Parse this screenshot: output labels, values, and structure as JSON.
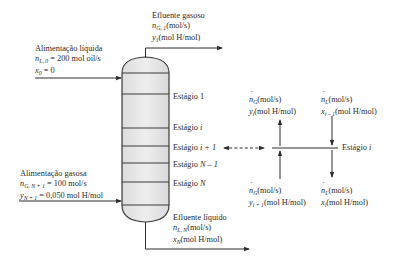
{
  "diagram": {
    "type": "absorption column schematic",
    "column": {
      "stages": [
        {
          "label_prefix": "Estágio",
          "index": "1"
        },
        {
          "label_prefix": "Estágio",
          "index": "i"
        },
        {
          "label_prefix": "Estágio",
          "index": "i + 1"
        },
        {
          "label_prefix": "Estágio",
          "index": "N – 1"
        },
        {
          "label_prefix": "Estágio",
          "index": "N"
        }
      ]
    },
    "liquid_feed": {
      "title": "Alimentação líquida",
      "flow_symbol": "n",
      "flow_sub": "L, 0",
      "flow_value": " = 200 mol oil/s",
      "comp_symbol": "x",
      "comp_sub": "0",
      "comp_value": " = 0"
    },
    "gas_effluent": {
      "title": "Efluente gasoso",
      "flow_symbol": "n",
      "flow_sub": "G, 1",
      "flow_unit": "(mol/s)",
      "comp_symbol": "y",
      "comp_sub": "1",
      "comp_unit": "(mol H/mol)"
    },
    "gas_feed": {
      "title": "Alimentação gasosa",
      "flow_symbol": "n",
      "flow_sub": "G, N + 1",
      "flow_value": " = 100 mol/s",
      "comp_symbol": "y",
      "comp_sub": "N + 1",
      "comp_value": " = 0,050 mol H/mol"
    },
    "liquid_effluent": {
      "title": "Efluente líquido",
      "flow_symbol": "n",
      "flow_sub": "L, N",
      "flow_unit": "(mol/s)",
      "comp_symbol": "x",
      "comp_sub": "N",
      "comp_unit": "(mol H/mol)"
    },
    "stage_detail": {
      "stage_label_prefix": "Estágio",
      "stage_label_index": "i",
      "gas_out": {
        "flow_symbol": "n",
        "flow_sub": "G",
        "flow_unit": "(mol/s)",
        "comp_symbol": "y",
        "comp_sub": "i",
        "comp_unit": "(mol H/mol)"
      },
      "liquid_in": {
        "flow_symbol": "n",
        "flow_sub": "L",
        "flow_unit": "(mol/s)",
        "comp_symbol": "x",
        "comp_sub": "i – 1",
        "comp_unit": "(mol H/mol)"
      },
      "gas_in": {
        "flow_symbol": "n",
        "flow_sub": "G",
        "flow_unit": "(mol/s)",
        "comp_symbol": "y",
        "comp_sub": "i + 1",
        "comp_unit": "(mol H/mol)"
      },
      "liquid_out": {
        "flow_symbol": "n",
        "flow_sub": "L",
        "flow_unit": "(mol/s)",
        "comp_symbol": "x",
        "comp_sub": "i",
        "comp_unit": "(mol H/mol)"
      }
    },
    "colors": {
      "line": "#2f2f2f",
      "column_fill": "#e6e6e6",
      "text": "#2a2a2a"
    }
  }
}
